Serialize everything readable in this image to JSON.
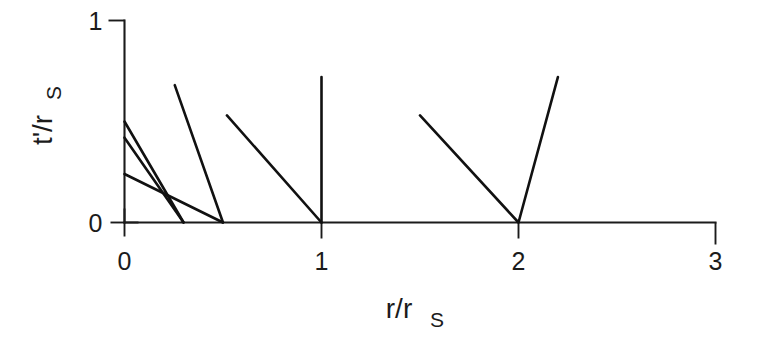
{
  "chart_data": {
    "type": "line",
    "title": "",
    "xlabel": "r/r_S",
    "xlabel_main": "r/r",
    "xlabel_sub": "S",
    "ylabel": "t'/r_S",
    "ylabel_main": "t'/r",
    "ylabel_sub": "S",
    "xlim": [
      0,
      3
    ],
    "ylim": [
      0,
      1
    ],
    "xticks": [
      0,
      1,
      2,
      3
    ],
    "xticklabels": [
      "0",
      "1",
      "2",
      "3"
    ],
    "yticks": [
      0,
      1
    ],
    "yticklabels": [
      "0",
      "1"
    ],
    "grid": false,
    "legend": false,
    "legend_position": "none",
    "line_color": "#111111",
    "axis_color": "#1b1b1b",
    "background": "#ffffff",
    "series": [
      {
        "name": "infall-from-0.50",
        "points": [
          [
            0.0,
            0.5
          ],
          [
            0.3,
            0.0
          ]
        ]
      },
      {
        "name": "infall-from-0.42",
        "points": [
          [
            0.0,
            0.42
          ],
          [
            0.3,
            0.0
          ]
        ]
      },
      {
        "name": "infall-from-0.24",
        "points": [
          [
            0.0,
            0.24
          ],
          [
            0.5,
            0.0
          ]
        ]
      },
      {
        "name": "infall-from-0.68",
        "points": [
          [
            0.255,
            0.68
          ],
          [
            0.5,
            0.0
          ]
        ]
      },
      {
        "name": "infall-from-0.53",
        "points": [
          [
            0.52,
            0.53
          ],
          [
            1.0,
            0.0
          ]
        ]
      },
      {
        "name": "vertical-at-1",
        "points": [
          [
            1.0,
            0.0
          ],
          [
            1.0,
            0.72
          ]
        ]
      },
      {
        "name": "v-shape-at-2",
        "points": [
          [
            1.5,
            0.53
          ],
          [
            2.0,
            0.0
          ],
          [
            2.2,
            0.72
          ]
        ]
      }
    ]
  },
  "figure": {
    "name": "spacetime-trajectory-plot"
  }
}
